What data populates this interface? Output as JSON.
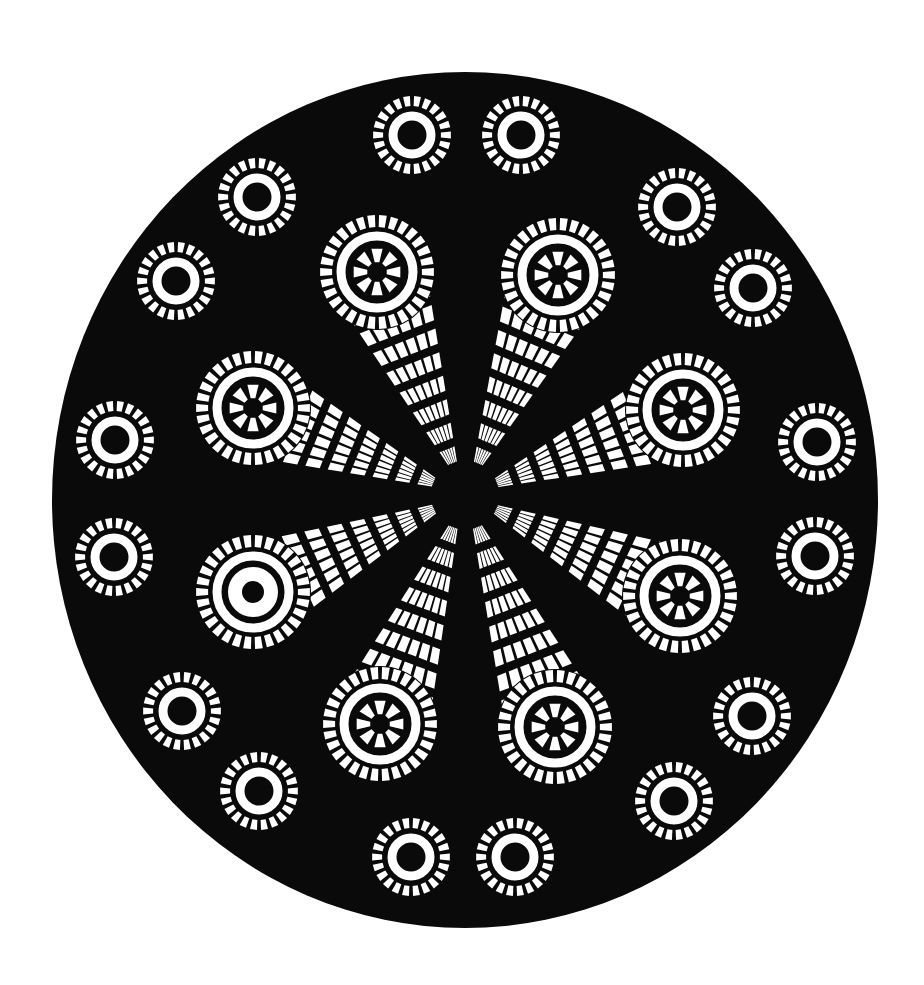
{
  "artwork": {
    "title": "",
    "colors": {
      "background": "#ffffff",
      "disc": "#0a0a0a",
      "pattern": "#ffffff"
    },
    "disc": {
      "cx": 465,
      "cy": 500,
      "rx": 413,
      "ry": 428
    },
    "center": {
      "cx": 465,
      "cy": 495
    },
    "small_rings": [
      {
        "cx": 412,
        "cy": 135
      },
      {
        "cx": 521,
        "cy": 135
      },
      {
        "cx": 257,
        "cy": 197
      },
      {
        "cx": 677,
        "cy": 207
      },
      {
        "cx": 176,
        "cy": 281
      },
      {
        "cx": 753,
        "cy": 288
      },
      {
        "cx": 115,
        "cy": 440
      },
      {
        "cx": 817,
        "cy": 442
      },
      {
        "cx": 114,
        "cy": 557
      },
      {
        "cx": 815,
        "cy": 556
      },
      {
        "cx": 182,
        "cy": 711
      },
      {
        "cx": 752,
        "cy": 716
      },
      {
        "cx": 259,
        "cy": 791
      },
      {
        "cx": 674,
        "cy": 801
      },
      {
        "cx": 411,
        "cy": 857
      },
      {
        "cx": 515,
        "cy": 857
      }
    ],
    "wheels": [
      {
        "name": "wheel-top-left",
        "cx": 377,
        "cy": 272,
        "spokes": true
      },
      {
        "name": "wheel-top-right",
        "cx": 558,
        "cy": 275,
        "spokes": true
      },
      {
        "name": "wheel-left-upper",
        "cx": 253,
        "cy": 408,
        "spokes": true
      },
      {
        "name": "wheel-right-upper",
        "cx": 683,
        "cy": 410,
        "spokes": true
      },
      {
        "name": "wheel-left-lower",
        "cx": 253,
        "cy": 592,
        "spokes": false
      },
      {
        "name": "wheel-right-lower",
        "cx": 680,
        "cy": 596,
        "spokes": true
      },
      {
        "name": "wheel-bottom-left",
        "cx": 380,
        "cy": 724,
        "spokes": true
      },
      {
        "name": "wheel-bottom-right",
        "cx": 555,
        "cy": 727,
        "spokes": true
      }
    ]
  }
}
